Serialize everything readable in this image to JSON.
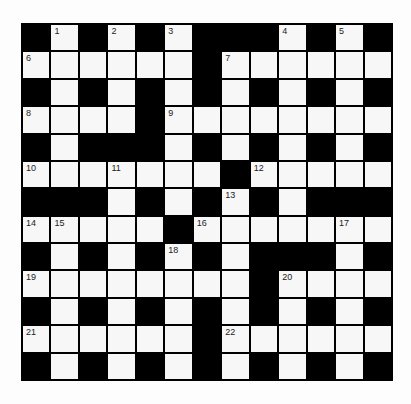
{
  "puzzle": {
    "type": "crossword",
    "rows": 13,
    "cols": 13,
    "layout": [
      "#.#.#.###.#.#",
      "......#......",
      "#.#.#.#.#.#.#",
      "....#........",
      "#.###.#.#.#.#",
      ".......#.....",
      "###.#.#.#.###",
      ".....#.......",
      "#.#.#.#.###.#",
      "........#....",
      "#.#.#.#.#.#.#",
      "......#......",
      "#.#.#.#.#.#.#"
    ],
    "numbers": [
      {
        "row": 0,
        "col": 1,
        "n": "1"
      },
      {
        "row": 0,
        "col": 3,
        "n": "2"
      },
      {
        "row": 0,
        "col": 5,
        "n": "3"
      },
      {
        "row": 0,
        "col": 9,
        "n": "4"
      },
      {
        "row": 0,
        "col": 11,
        "n": "5"
      },
      {
        "row": 1,
        "col": 0,
        "n": "6"
      },
      {
        "row": 1,
        "col": 7,
        "n": "7"
      },
      {
        "row": 3,
        "col": 0,
        "n": "8"
      },
      {
        "row": 3,
        "col": 5,
        "n": "9"
      },
      {
        "row": 5,
        "col": 0,
        "n": "10"
      },
      {
        "row": 5,
        "col": 3,
        "n": "11"
      },
      {
        "row": 5,
        "col": 8,
        "n": "12"
      },
      {
        "row": 6,
        "col": 7,
        "n": "13"
      },
      {
        "row": 7,
        "col": 0,
        "n": "14"
      },
      {
        "row": 7,
        "col": 1,
        "n": "15"
      },
      {
        "row": 7,
        "col": 6,
        "n": "16"
      },
      {
        "row": 7,
        "col": 11,
        "n": "17"
      },
      {
        "row": 8,
        "col": 5,
        "n": "18"
      },
      {
        "row": 9,
        "col": 0,
        "n": "19"
      },
      {
        "row": 9,
        "col": 9,
        "n": "20"
      },
      {
        "row": 11,
        "col": 0,
        "n": "21"
      },
      {
        "row": 11,
        "col": 7,
        "n": "22"
      }
    ],
    "colors": {
      "block": "#000000",
      "cell": "#f7f7f7",
      "number": "#222222"
    }
  }
}
